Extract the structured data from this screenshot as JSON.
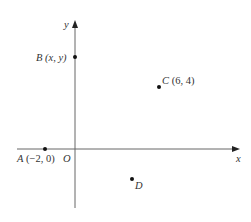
{
  "diagram": {
    "type": "coordinate-plane",
    "axes": {
      "x_label": "x",
      "y_label": "y",
      "origin_label": "O",
      "color": "#555555"
    },
    "points": [
      {
        "name": "A",
        "coords": "(−2, 0)",
        "x": -2,
        "y": 0
      },
      {
        "name": "B",
        "coords": "(x, y)"
      },
      {
        "name": "C",
        "coords": "(6, 4)",
        "x": 6,
        "y": 4
      },
      {
        "name": "D",
        "coords": ""
      }
    ]
  }
}
